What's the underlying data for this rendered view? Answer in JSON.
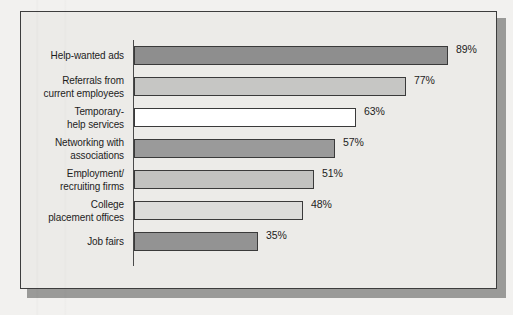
{
  "figure": {
    "background_color": "#ecebe8",
    "border_color": "#3d3d3d",
    "shadow_color": "#9a9a98",
    "axis_color": "#4a4a4a"
  },
  "chart_data": {
    "type": "bar",
    "orientation": "horizontal",
    "title": "",
    "subtitle": "",
    "xlabel": "",
    "ylabel": "",
    "xlim": [
      0,
      100
    ],
    "grid": false,
    "legend": "none",
    "value_suffix": "%",
    "categories": [
      "Help-wanted ads",
      "Referrals from current employees",
      "Temporary-help services",
      "Networking with associations",
      "Employment/ recruiting firms",
      "College placement offices",
      "Job fairs"
    ],
    "values": [
      89,
      77,
      63,
      57,
      51,
      48,
      35
    ],
    "data_labels": [
      "89%",
      "77%",
      "63%",
      "57%",
      "51%",
      "48%",
      "35%"
    ],
    "bar_colors": [
      "#8e8e8e",
      "#c6c6c4",
      "#ffffff",
      "#9a9a9a",
      "#c2c2c0",
      "#dcdcda",
      "#939393"
    ]
  },
  "bars": [
    {
      "label_line1": "Help-wanted ads",
      "label_line2": "",
      "value_label": "89%",
      "value": 89,
      "fill": "#8e8e8e"
    },
    {
      "label_line1": "Referrals from",
      "label_line2": "current employees",
      "value_label": "77%",
      "value": 77,
      "fill": "#c6c6c4"
    },
    {
      "label_line1": "Temporary-",
      "label_line2": "help services",
      "value_label": "63%",
      "value": 63,
      "fill": "#ffffff"
    },
    {
      "label_line1": "Networking with",
      "label_line2": "associations",
      "value_label": "57%",
      "value": 57,
      "fill": "#9a9a9a"
    },
    {
      "label_line1": "Employment/",
      "label_line2": "recruiting firms",
      "value_label": "51%",
      "value": 51,
      "fill": "#c2c2c0"
    },
    {
      "label_line1": "College",
      "label_line2": "placement offices",
      "value_label": "48%",
      "value": 48,
      "fill": "#dcdcda"
    },
    {
      "label_line1": "Job fairs",
      "label_line2": "",
      "value_label": "35%",
      "value": 35,
      "fill": "#939393"
    }
  ]
}
